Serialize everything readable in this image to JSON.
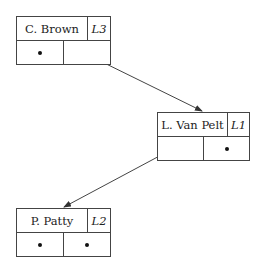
{
  "diagram": {
    "type": "binary-tree-linked-nodes",
    "nodes": [
      {
        "id": "n1",
        "name": "C. Brown",
        "label": "L3",
        "left": "null",
        "right": "pointer"
      },
      {
        "id": "n2",
        "name": "L. Van Pelt",
        "label": "L1",
        "left": "pointer",
        "right": "null"
      },
      {
        "id": "n3",
        "name": "P. Patty",
        "label": "L2",
        "left": "null",
        "right": "null"
      }
    ],
    "edges": [
      {
        "from": "n1.right",
        "to": "n2"
      },
      {
        "from": "n2.left",
        "to": "n3"
      }
    ],
    "null_symbol": "bullet-dot",
    "colors": {
      "line": "#444444",
      "background": "#ffffff",
      "text": "#222222"
    }
  }
}
